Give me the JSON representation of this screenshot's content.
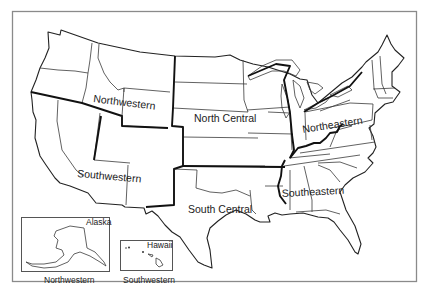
{
  "map": {
    "title": "United States regions",
    "regions": [
      {
        "id": "northwestern",
        "label": "Northwestern"
      },
      {
        "id": "southwestern",
        "label": "Southwestern"
      },
      {
        "id": "north-central",
        "label": "North Central"
      },
      {
        "id": "south-central",
        "label": "South Central"
      },
      {
        "id": "northeastern",
        "label": "Northeastern"
      },
      {
        "id": "southeastern",
        "label": "Southeastern"
      }
    ],
    "insets": {
      "alaska": {
        "name": "Alaska",
        "region": "Northwestern"
      },
      "hawaii": {
        "name": "Hawaii",
        "region": "Southwestern"
      }
    }
  }
}
